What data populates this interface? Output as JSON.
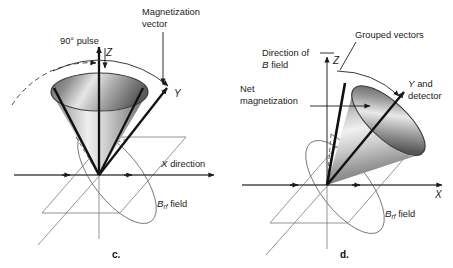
{
  "figure": {
    "type": "diagram",
    "background_color": "#ffffff",
    "ink_color": "#1b1b1b",
    "thin_line_color": "#6e6e6e"
  },
  "panels": [
    {
      "id": "c",
      "letter": "c.",
      "labels": {
        "magnetization_vector": "Magnetization",
        "magnetization_vector_line2": "vector",
        "pulse": "90° pulse",
        "x_axis": "X direction",
        "brf_field_b": "B",
        "brf_field_sub": "rf",
        "brf_field_word": "field",
        "axis_z": "Z",
        "axis_y": "Y"
      }
    },
    {
      "id": "d",
      "letter": "d.",
      "labels": {
        "direction_of": "Direction of",
        "b_field_b": "B",
        "b_field_word": "field",
        "net": "Net",
        "net_line2": "magnetization",
        "grouped_vectors": "Grouped vectors",
        "y_detector": "Y and",
        "y_detector_line2": "detector",
        "axis_z": "Z",
        "axis_x": "X",
        "brf_field_b": "B",
        "brf_field_sub": "rf",
        "brf_field_word": "field"
      }
    }
  ]
}
